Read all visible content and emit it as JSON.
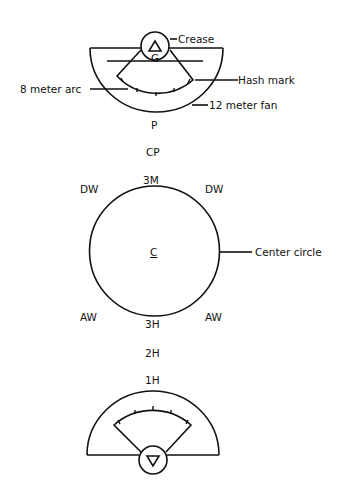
{
  "diagram": {
    "type": "field-layout",
    "colors": {
      "ink": "#111111",
      "background": "#ffffff"
    },
    "top_goal": {
      "goal_symbol": "triangle-up",
      "labels": {
        "crease": "Crease",
        "hash_mark": "Hash mark",
        "eight_meter_arc": "8 meter arc",
        "twelve_meter_fan": "12 meter fan",
        "goalie": "G"
      }
    },
    "positions": {
      "point": "P",
      "cover_point": "CP",
      "three_man": "3M",
      "defensive_wing_left": "DW",
      "defensive_wing_right": "DW",
      "center": "C",
      "attack_wing_left": "AW",
      "attack_wing_right": "AW",
      "three_home": "3H",
      "two_home": "2H",
      "one_home": "1H"
    },
    "center_circle_label": "Center circle",
    "bottom_goal": {
      "goal_symbol": "triangle-down"
    }
  }
}
